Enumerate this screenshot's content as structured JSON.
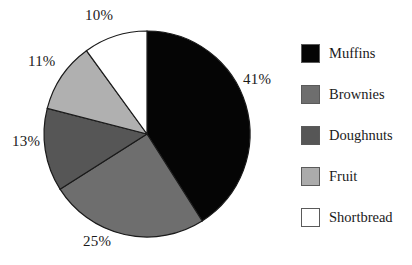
{
  "chart_data": {
    "type": "pie",
    "title": "",
    "categories": [
      "Muffins",
      "Brownies",
      "Doughnuts",
      "Fruit",
      "Shortbread"
    ],
    "values": [
      41,
      25,
      13,
      11,
      10
    ],
    "value_unit": "%",
    "data_labels": [
      "41%",
      "25%",
      "13%",
      "11%",
      "10%"
    ],
    "colors": [
      "#050505",
      "#6e6e6e",
      "#565656",
      "#b0b0b0",
      "#ffffff"
    ],
    "slice_order": "clockwise from 12 o'clock",
    "legend_position": "right",
    "legend_entries": [
      {
        "label": "Muffins",
        "color": "#050505",
        "value": 41
      },
      {
        "label": "Brownies",
        "color": "#6e6e6e",
        "value": 25
      },
      {
        "label": "Doughnuts",
        "color": "#565656",
        "value": 13
      },
      {
        "label": "Fruit",
        "color": "#ababab",
        "value": 11
      },
      {
        "label": "Shortbread",
        "color": "#ffffff",
        "value": 10
      }
    ],
    "xlabel": "",
    "ylabel": "",
    "grid": false
  },
  "labels": {
    "muffins_pct": "41%",
    "brownies_pct": "25%",
    "doughnuts_pct": "13%",
    "fruit_pct": "11%",
    "shortbread_pct": "10%"
  },
  "legend": {
    "items": [
      {
        "label": "Muffins"
      },
      {
        "label": "Brownies"
      },
      {
        "label": "Doughnuts"
      },
      {
        "label": "Fruit"
      },
      {
        "label": "Shortbread"
      }
    ]
  },
  "style": {
    "slice_outline": "#1a1a1a",
    "text_color": "#1a1a1a",
    "background": "#ffffff"
  }
}
